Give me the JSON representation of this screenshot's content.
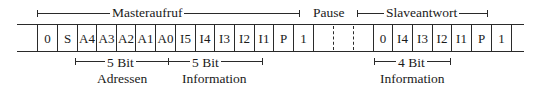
{
  "top_labels": {
    "master": "Masteraufruf",
    "pause": "Pause",
    "slave": "Slaveantwort"
  },
  "master_cells": [
    "0",
    "S",
    "A4",
    "A3",
    "A2",
    "A1",
    "A0",
    "I5",
    "I4",
    "I3",
    "I2",
    "I1",
    "P",
    "1"
  ],
  "slave_cells": [
    "0",
    "I4",
    "I3",
    "I2",
    "I1",
    "P",
    "1"
  ],
  "bottom_labels": {
    "address": {
      "bits": "5 Bit",
      "desc": "Adressen"
    },
    "master_info": {
      "bits": "5 Bit",
      "desc": "Information"
    },
    "slave_info": {
      "bits": "4 Bit",
      "desc": "Information"
    }
  }
}
